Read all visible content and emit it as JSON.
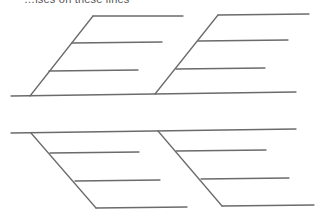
{
  "diagram": {
    "type": "fishbone",
    "top_text_cropped": "…ises on these lines",
    "line_color": "#6b6b6b",
    "spines": [
      {
        "id": "upper",
        "spine": {
          "x1": 11,
          "y1": 96,
          "x2": 296,
          "y2": 92
        },
        "bones": [
          {
            "id": "upper-left",
            "x1": 30,
            "y1": 96,
            "x2": 93,
            "y2": 16,
            "ribs": [
              {
                "x1": 93,
                "y1": 16,
                "x2": 183,
                "y2": 16
              },
              {
                "x1": 72,
                "y1": 43,
                "x2": 162,
                "y2": 42
              },
              {
                "x1": 49,
                "y1": 71,
                "x2": 138,
                "y2": 70
              }
            ]
          },
          {
            "id": "upper-right",
            "x1": 155,
            "y1": 94,
            "x2": 218,
            "y2": 15,
            "ribs": [
              {
                "x1": 218,
                "y1": 15,
                "x2": 309,
                "y2": 14
              },
              {
                "x1": 198,
                "y1": 41,
                "x2": 288,
                "y2": 40
              },
              {
                "x1": 176,
                "y1": 69,
                "x2": 265,
                "y2": 68
              }
            ]
          }
        ]
      },
      {
        "id": "lower",
        "spine": {
          "x1": 11,
          "y1": 133,
          "x2": 296,
          "y2": 129
        },
        "bones": [
          {
            "id": "lower-left",
            "x1": 31,
            "y1": 133,
            "x2": 96,
            "y2": 208,
            "ribs": [
              {
                "x1": 50,
                "y1": 153,
                "x2": 139,
                "y2": 152
              },
              {
                "x1": 75,
                "y1": 181,
                "x2": 160,
                "y2": 180
              },
              {
                "x1": 96,
                "y1": 208,
                "x2": 187,
                "y2": 207
              }
            ]
          },
          {
            "id": "lower-right",
            "x1": 158,
            "y1": 131,
            "x2": 222,
            "y2": 206,
            "ribs": [
              {
                "x1": 176,
                "y1": 151,
                "x2": 266,
                "y2": 150
              },
              {
                "x1": 201,
                "y1": 179,
                "x2": 289,
                "y2": 178
              },
              {
                "x1": 222,
                "y1": 206,
                "x2": 314,
                "y2": 205
              }
            ]
          }
        ]
      }
    ]
  }
}
